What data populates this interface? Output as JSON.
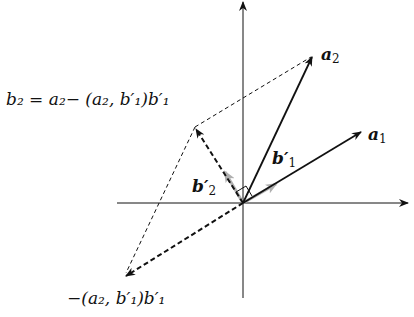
{
  "diagram": {
    "labels": {
      "a2": "a",
      "a2_sub": "2",
      "a1": "a",
      "a1_sub": "1",
      "b1p": "b′",
      "b1p_sub": "1",
      "b2p": "b′",
      "b2p_sub": "2",
      "b2_formula": "b₂ = a₂− (a₂, b′₁)b′₁",
      "neg_proj": "−(a₂, b′₁)b′₁"
    },
    "vectors": [
      {
        "name": "a1",
        "from": [
          243,
          203
        ],
        "to": [
          362,
          131
        ],
        "style": "solid"
      },
      {
        "name": "a2",
        "from": [
          243,
          203
        ],
        "to": [
          313,
          55
        ],
        "style": "solid"
      },
      {
        "name": "b2",
        "from": [
          243,
          203
        ],
        "to": [
          195,
          127
        ],
        "style": "dashed"
      },
      {
        "name": "neg-projection",
        "from": [
          243,
          203
        ],
        "to": [
          124,
          277
        ],
        "style": "dashed"
      },
      {
        "name": "b1-unit",
        "from": [
          243,
          203
        ],
        "to": [
          275,
          184
        ],
        "style": "gray"
      },
      {
        "name": "b2-unit",
        "from": [
          243,
          203
        ],
        "to": [
          225,
          173
        ],
        "style": "gray"
      }
    ],
    "colors": {
      "ink": "#111111",
      "unit": "#b0b0b0",
      "bg": "#ffffff"
    }
  }
}
